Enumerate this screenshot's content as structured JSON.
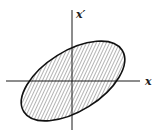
{
  "diagram": {
    "type": "phase-space-ellipse",
    "x_axis_label": "x",
    "y_axis_label": "x′",
    "colors": {
      "stroke": "#1a1a1a",
      "hatch": "#333333",
      "background": "#ffffff"
    },
    "ellipse": {
      "cx": 73,
      "cy": 81,
      "rx": 58,
      "ry": 30,
      "rotation_deg": -32,
      "fill": "diagonal-hatch"
    }
  }
}
